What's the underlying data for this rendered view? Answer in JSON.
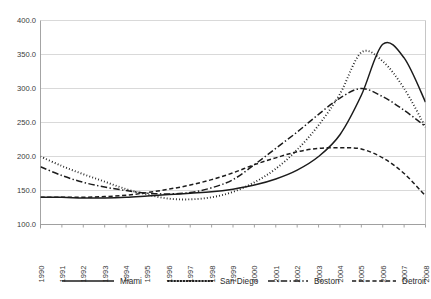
{
  "chart_data": {
    "type": "line",
    "title": "",
    "subtitle": "",
    "xlabel": "",
    "ylabel": "",
    "x": [
      1990,
      1991,
      1992,
      1993,
      1994,
      1995,
      1996,
      1997,
      1998,
      1999,
      2000,
      2001,
      2002,
      2003,
      2004,
      2005,
      2006,
      2007,
      2008
    ],
    "categories": [
      "1990",
      "1991",
      "1992",
      "1993",
      "1994",
      "1995",
      "1996",
      "1997",
      "1998",
      "1999",
      "2000",
      "2001",
      "2002",
      "2003",
      "2004",
      "2005",
      "2006",
      "2007",
      "2008"
    ],
    "ylim": [
      100.0,
      400.0
    ],
    "ytick_values": [
      100.0,
      150.0,
      200.0,
      250.0,
      300.0,
      350.0,
      400.0
    ],
    "ytick_labels": [
      "100.0",
      "150.0",
      "200.0",
      "250.0",
      "300.0",
      "350.0",
      "400.0"
    ],
    "grid": "horizontal",
    "legend_position": "bottom",
    "series": [
      {
        "name": "Miami",
        "style": "solid",
        "color": "#1c1c1c",
        "values": [
          140,
          140,
          139,
          139,
          140,
          142,
          144,
          146,
          148,
          152,
          158,
          167,
          180,
          200,
          232,
          290,
          365,
          345,
          280
        ]
      },
      {
        "name": "San Diego",
        "style": "dotted",
        "color": "#1c1c1c",
        "values": [
          200,
          186,
          174,
          163,
          152,
          144,
          138,
          137,
          140,
          148,
          162,
          182,
          210,
          246,
          292,
          353,
          340,
          300,
          243
        ]
      },
      {
        "name": "Boston",
        "style": "dash-dot",
        "color": "#1c1c1c",
        "values": [
          185,
          172,
          162,
          155,
          150,
          146,
          145,
          147,
          154,
          166,
          188,
          212,
          236,
          262,
          286,
          300,
          288,
          268,
          244
        ]
      },
      {
        "name": "Detroit",
        "style": "dashed",
        "color": "#1c1c1c",
        "values": [
          140,
          140,
          140,
          141,
          143,
          147,
          152,
          158,
          166,
          176,
          188,
          198,
          207,
          212,
          213,
          211,
          198,
          175,
          142
        ]
      }
    ]
  },
  "legend": {
    "items": [
      {
        "label": "Miami",
        "style": "solid"
      },
      {
        "label": "San Diego",
        "style": "dotted"
      },
      {
        "label": "Boston",
        "style": "dash-dot"
      },
      {
        "label": "Detroit",
        "style": "dashed"
      }
    ]
  },
  "colors": {
    "ink": "#1c1c1c",
    "grid": "#c9c9c9",
    "axis": "#9a9a9a",
    "frame": "#b8b8b8",
    "background": "#ffffff",
    "tick_text": "#3a3a3a"
  }
}
